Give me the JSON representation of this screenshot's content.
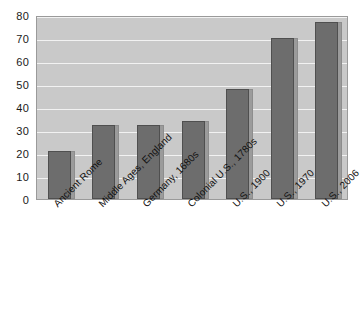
{
  "chart_data": {
    "type": "bar",
    "title": "",
    "subtitle": "",
    "xlabel": "",
    "ylabel": "",
    "ylim": [
      0,
      80
    ],
    "yticks": [
      0,
      10,
      20,
      30,
      40,
      50,
      60,
      70,
      80
    ],
    "grid": true,
    "legend": null,
    "orientation": "vertical",
    "categories": [
      "Ancient Rome",
      "Middle Ages, England",
      "Germany, 1680s",
      "Colonial U.S., 1780s",
      "U.S., 1900",
      "U.S., 1970",
      "U.S., 2006"
    ],
    "values": [
      21,
      32,
      32,
      34,
      48,
      70,
      77
    ],
    "series": [
      {
        "name": "",
        "values": [
          21,
          32,
          32,
          34,
          48,
          70,
          77
        ]
      }
    ],
    "colors": {
      "bar": "#6d6d6d",
      "bar_shadow": "#9b9b9b",
      "plot_background": "#c9c9c9",
      "gridline": "#f2f2f2",
      "frame": "#9a9a9a",
      "page_background": "#ffffff",
      "text": "#111111"
    }
  }
}
